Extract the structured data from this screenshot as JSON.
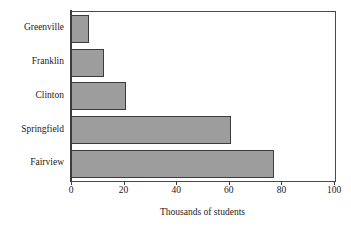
{
  "chart_data": {
    "type": "bar",
    "orientation": "horizontal",
    "title": "",
    "xlabel": "Thousands of students",
    "ylabel": "",
    "categories": [
      "Greenville",
      "Franklin",
      "Clinton",
      "Springfield",
      "Fairview"
    ],
    "values": [
      7,
      12.5,
      21,
      61,
      77
    ],
    "series": [
      {
        "name": "Thousands of students",
        "values": [
          7,
          12.5,
          21,
          61,
          77
        ]
      }
    ],
    "xlim": [
      0,
      100
    ],
    "xticks": [
      0,
      20,
      40,
      60,
      80,
      100
    ],
    "xtick_labels": [
      "0",
      "20",
      "40",
      "60",
      "80",
      "100"
    ],
    "grid": false,
    "legend": false,
    "bar_color": "#9d9d9d",
    "bar_edge_color": "#3c3c3c",
    "axis_color": "#3c3c3c",
    "background_color": "#ffffff"
  }
}
